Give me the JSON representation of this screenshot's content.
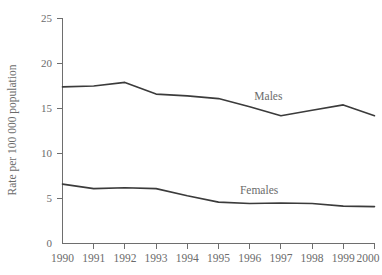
{
  "chart_data": {
    "type": "line",
    "title": "",
    "xlabel": "",
    "ylabel": "Rate per 100 000 population",
    "x": [
      1990,
      1991,
      1992,
      1993,
      1994,
      1995,
      1996,
      1997,
      1998,
      1999,
      2000
    ],
    "xtick_labels": [
      "1990",
      "1991",
      "1992",
      "1993",
      "1994",
      "1995",
      "1996",
      "1997",
      "1998",
      "1999",
      "2000"
    ],
    "ytick_labels": [
      "0",
      "5",
      "10",
      "15",
      "20",
      "25"
    ],
    "yticks": [
      0,
      5,
      10,
      15,
      20,
      25
    ],
    "ylim": [
      0,
      25
    ],
    "xlim": [
      1990,
      2000
    ],
    "grid": false,
    "legend_position": "inline-annotation",
    "series": [
      {
        "name": "Males",
        "label": "Males",
        "color": "#3b3b3b",
        "values": [
          17.4,
          17.5,
          17.9,
          16.6,
          16.4,
          16.1,
          15.2,
          14.2,
          14.8,
          15.4,
          14.2
        ]
      },
      {
        "name": "Females",
        "label": "Females",
        "color": "#3b3b3b",
        "values": [
          6.6,
          6.1,
          6.2,
          6.1,
          5.3,
          4.6,
          4.45,
          4.5,
          4.45,
          4.15,
          4.1
        ]
      }
    ],
    "annotations": [
      {
        "text": "Males",
        "x": 1996.6,
        "y": 15.9
      },
      {
        "text": "Females",
        "x": 1996.3,
        "y": 5.5
      }
    ]
  },
  "axes": {
    "y_title": "Rate per 100 000 population",
    "y_ticks": [
      "25",
      "20",
      "15",
      "10",
      "5",
      "0"
    ],
    "x_ticks": [
      "1990",
      "1991",
      "1992",
      "1993",
      "1994",
      "1995",
      "1996",
      "1997",
      "1998",
      "1999",
      "2000"
    ]
  },
  "labels": {
    "males": "Males",
    "females": "Females"
  },
  "colors": {
    "line": "#3b3b3b",
    "axis": "#6e6e6e",
    "text": "#6b6b6b",
    "background": "#ffffff"
  }
}
